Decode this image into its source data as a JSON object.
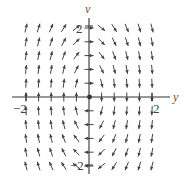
{
  "chart_data": {
    "type": "vector_field",
    "title": "",
    "xlabel": "y",
    "ylabel": "v",
    "xlim": [
      -2,
      2
    ],
    "ylim": [
      -2,
      2
    ],
    "x_ticks": [
      {
        "value": -2,
        "label": "−2"
      },
      {
        "value": 2,
        "label": "2"
      }
    ],
    "y_ticks": [
      {
        "value": 2,
        "label": "2"
      },
      {
        "value": -2,
        "label": "−2"
      }
    ],
    "grid": false,
    "legend": null,
    "field": {
      "dy_dt": "v",
      "dv_dt": "-k*y",
      "k_estimate": 4
    },
    "sample_columns_y": [
      -2,
      -1.6,
      -1.2,
      -0.8,
      -0.4,
      0,
      0.4,
      0.8,
      1.2,
      1.6,
      2
    ],
    "sample_rows_v": [
      2,
      1.6,
      1.2,
      0.8,
      0.4,
      0,
      -0.4,
      -0.8,
      -1.2,
      -1.6,
      -2
    ],
    "origin_marker": "equilibrium point at (0,0)"
  },
  "labels": {
    "x_axis": "y",
    "y_axis": "v",
    "x_tick_neg": "−2",
    "x_tick_pos": "2",
    "y_tick_pos": "2",
    "y_tick_neg": "−2"
  }
}
